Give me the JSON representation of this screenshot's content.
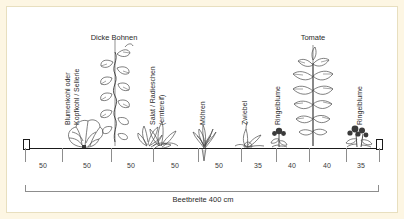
{
  "diagram": {
    "title_total": "Beetbreite 400 cm",
    "total_cm": 400,
    "unit": "cm",
    "ground_label": "ground-line",
    "border_color": "#fdf6e3",
    "line_color": "#1a1a1a",
    "text_color": "#2a2a2a"
  },
  "plants": [
    {
      "id": "blumenkohl",
      "label_line1": "Blumenkohl oder",
      "label_line2": "Kopfkohl / Sellerie",
      "orientation": "vertical",
      "x": 75,
      "icon": "cabbage-icon"
    },
    {
      "id": "dicke-bohnen",
      "label_line1": "Dicke Bohnen",
      "label_line2": "",
      "orientation": "horizontal",
      "x": 107,
      "icon": "bean-vine-icon"
    },
    {
      "id": "salat",
      "label_line1": "Salat / Radieschen",
      "label_line2": "(erntereif)",
      "orientation": "vertical",
      "x": 152,
      "icon": "lettuce-icon"
    },
    {
      "id": "moehren",
      "label_line1": "Möhren",
      "label_line2": "",
      "orientation": "vertical",
      "x": 197,
      "icon": "carrot-icon"
    },
    {
      "id": "zwiebel",
      "label_line1": "Zwiebel",
      "label_line2": "",
      "orientation": "vertical",
      "x": 240,
      "icon": "onion-icon"
    },
    {
      "id": "ringelblume-1",
      "label_line1": "Ringelblume",
      "label_line2": "",
      "orientation": "vertical",
      "x": 271,
      "icon": "marigold-icon"
    },
    {
      "id": "tomate",
      "label_line1": "Tomate",
      "label_line2": "",
      "orientation": "horizontal",
      "x": 306,
      "icon": "tomato-plant-icon"
    },
    {
      "id": "ringelblume-2",
      "label_line1": "Ringelblume",
      "label_line2": "",
      "orientation": "vertical",
      "x": 351,
      "icon": "marigold-icon"
    }
  ],
  "spacings": [
    {
      "value": "50",
      "center": 36
    },
    {
      "value": "50",
      "center": 80
    },
    {
      "value": "50",
      "center": 124
    },
    {
      "value": "50",
      "center": 168
    },
    {
      "value": "50",
      "center": 212
    },
    {
      "value": "35",
      "center": 251
    },
    {
      "value": "40",
      "center": 285
    },
    {
      "value": "40",
      "center": 320
    },
    {
      "value": "35",
      "center": 354
    }
  ],
  "ticks": [
    18,
    55,
    104,
    146,
    191,
    234,
    269,
    302,
    339,
    372
  ],
  "end_posts": [
    "left-post",
    "right-post"
  ]
}
